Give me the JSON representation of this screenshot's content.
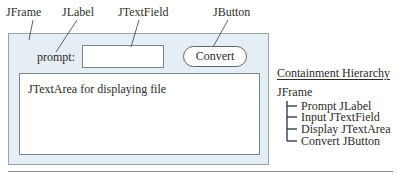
{
  "callouts": {
    "jframe": "JFrame",
    "jlabel": "JLabel",
    "jtextfield": "JTextField",
    "jbutton": "JButton"
  },
  "window": {
    "prompt_label": "prompt:",
    "text_field_value": "",
    "convert_button_label": "Convert",
    "text_area_content": "JTextArea for displaying file"
  },
  "hierarchy": {
    "title": "Containment Hierarchy",
    "root": "JFrame",
    "children": [
      "Prompt JLabel",
      "Input JTextField",
      "Display JTextArea",
      "Convert JButton"
    ]
  },
  "colors": {
    "frame_fill": "#e5eef5",
    "frame_border": "#9aa3ab",
    "text": "#2b2b2b"
  }
}
